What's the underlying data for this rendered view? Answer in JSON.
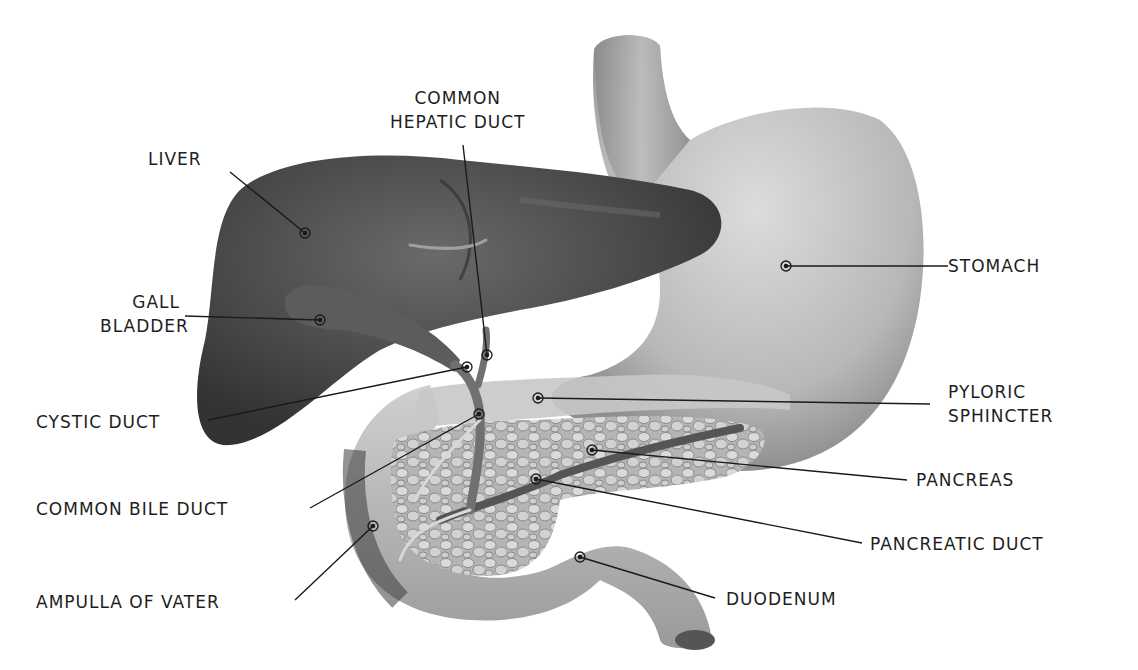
{
  "diagram": {
    "type": "anatomical-illustration",
    "colors": {
      "background": "#ffffff",
      "label_text": "#1e1e1e",
      "leader_line": "#1a1a1a",
      "liver": "#4a4a4a",
      "stomach": "#bdbdbd",
      "pancreas": "#a8a8a8",
      "duodenum": "#c4c4c4",
      "ducts": "#5e5e5e"
    },
    "labels": {
      "common_hepatic_duct_line1": "COMMON",
      "common_hepatic_duct_line2": "HEPATIC DUCT",
      "liver": "LIVER",
      "gall_bladder_line1": "GALL",
      "gall_bladder_line2": "BLADDER",
      "cystic_duct": "CYSTIC DUCT",
      "common_bile_duct": "COMMON BILE DUCT",
      "ampulla_of_vater": "AMPULLA OF VATER",
      "stomach": "STOMACH",
      "pyloric_sphincter_line1": "PYLORIC",
      "pyloric_sphincter_line2": "SPHINCTER",
      "pancreas": "PANCREAS",
      "pancreatic_duct": "PANCREATIC DUCT",
      "duodenum": "DUODENUM"
    }
  }
}
